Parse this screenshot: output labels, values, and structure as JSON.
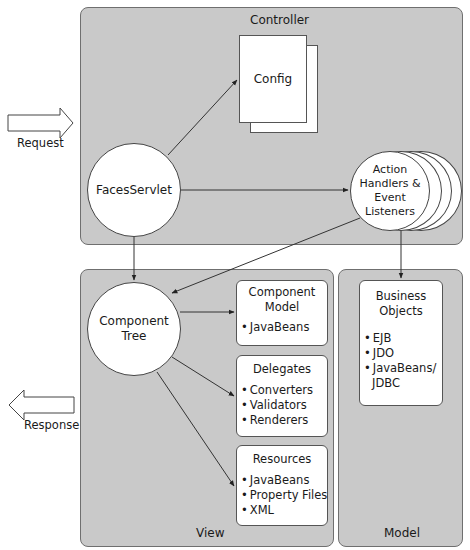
{
  "panels": {
    "controller": "Controller",
    "view": "View",
    "model": "Model"
  },
  "nodes": {
    "faces_servlet": "FacesServlet",
    "config": "Config",
    "action_handlers": [
      "Action",
      "Handlers &",
      "Event",
      "Listeners"
    ],
    "component_tree": [
      "Component",
      "Tree"
    ]
  },
  "view_boxes": {
    "component_model": {
      "title": [
        "Component",
        "Model"
      ],
      "items": [
        "JavaBeans"
      ]
    },
    "delegates": {
      "title": [
        "Delegates"
      ],
      "items": [
        "Converters",
        "Validators",
        "Renderers"
      ]
    },
    "resources": {
      "title": [
        "Resources"
      ],
      "items": [
        "JavaBeans",
        "Property Files",
        "XML"
      ]
    }
  },
  "model_box": {
    "title": [
      "Business",
      "Objects"
    ],
    "items": [
      "EJB",
      "JDO",
      "JavaBeans/",
      "JDBC"
    ]
  },
  "external": {
    "request": "Request",
    "response": "Response"
  },
  "colors": {
    "panel_fill": "#c9c9c9",
    "panel_border": "#6f6f6f",
    "node_fill": "#ffffff",
    "line": "#333333"
  }
}
